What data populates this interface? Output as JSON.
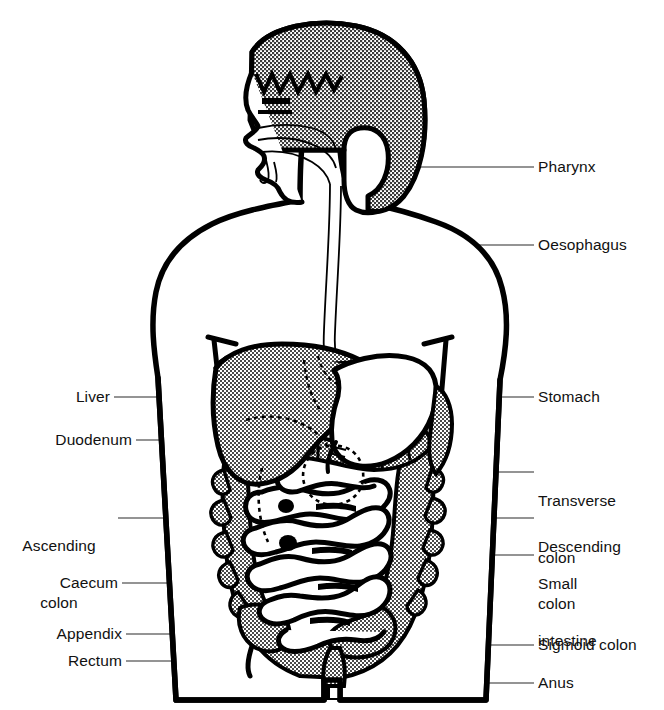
{
  "figure": {
    "type": "anatomical-diagram",
    "view": "anterior torso with left-facing head profile",
    "background_color": "#ffffff",
    "ink_color": "#000000",
    "fill_shaded": "stipple/halftone grey",
    "fill_plain": "white"
  },
  "labels": {
    "pharynx": "Pharynx",
    "oesophagus": "Oesophagus",
    "liver": "Liver",
    "duodenum": "Duodenum",
    "ascending_colon_line1": "Ascending",
    "ascending_colon_line2": "colon",
    "caecum": "Caecum",
    "appendix": "Appendix",
    "rectum": "Rectum",
    "stomach": "Stomach",
    "transverse_colon_line1": "Transverse",
    "transverse_colon_line2": "colon",
    "descending_colon_line1": "Descending",
    "descending_colon_line2": "colon",
    "small_intestine_line1": "Small",
    "small_intestine_line2": "intestine",
    "sigmoid_colon": "Sigmoid colon",
    "anus": "Anus"
  },
  "parts": [
    {
      "name": "pharynx",
      "label": "Pharynx",
      "side": "right",
      "shaded": false
    },
    {
      "name": "oesophagus",
      "label": "Oesophagus",
      "side": "right",
      "shaded": false
    },
    {
      "name": "stomach",
      "label": "Stomach",
      "side": "right",
      "shaded": false
    },
    {
      "name": "transverse-colon",
      "label": "Transverse colon",
      "side": "right",
      "shaded": true
    },
    {
      "name": "descending-colon",
      "label": "Descending colon",
      "side": "right",
      "shaded": true
    },
    {
      "name": "small-intestine",
      "label": "Small intestine",
      "side": "right",
      "shaded": false
    },
    {
      "name": "sigmoid-colon",
      "label": "Sigmoid colon",
      "side": "right",
      "shaded": true
    },
    {
      "name": "anus",
      "label": "Anus",
      "side": "right",
      "shaded": false
    },
    {
      "name": "liver",
      "label": "Liver",
      "side": "left",
      "shaded": true
    },
    {
      "name": "duodenum",
      "label": "Duodenum",
      "side": "left",
      "shaded": false
    },
    {
      "name": "ascending-colon",
      "label": "Ascending colon",
      "side": "left",
      "shaded": true
    },
    {
      "name": "caecum",
      "label": "Caecum",
      "side": "left",
      "shaded": true
    },
    {
      "name": "appendix",
      "label": "Appendix",
      "side": "left",
      "shaded": false
    },
    {
      "name": "rectum",
      "label": "Rectum",
      "side": "left",
      "shaded": true
    }
  ]
}
